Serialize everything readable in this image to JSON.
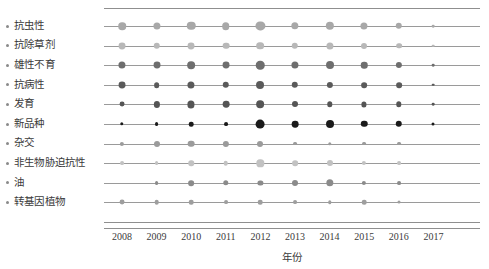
{
  "chart_data": {
    "type": "scatter",
    "title": "",
    "xlabel": "年份",
    "ylabel": "",
    "x": [
      2008,
      2009,
      2010,
      2011,
      2012,
      2013,
      2014,
      2015,
      2016,
      2017
    ],
    "xtick_labels": [
      "2008",
      "2009",
      "2010",
      "2011",
      "2012",
      "2013",
      "2014",
      "2015",
      "2016",
      "2017"
    ],
    "xlim": [
      2007.5,
      2017.5
    ],
    "grid": false,
    "legend": "none",
    "bubble_encoding": "marker area proportional to count; row color darkness distinguishes category",
    "categories": [
      "抗虫性",
      "抗除草剂",
      "雄性不育",
      "抗病性",
      "发育",
      "新品种",
      "杂交",
      "非生物胁迫抗性",
      "油",
      "转基因植物"
    ],
    "series": [
      {
        "name": "抗虫性",
        "color": "#a8a8a8",
        "values": [
          9.5,
          8.5,
          12.0,
          9.5,
          14.0,
          9.0,
          11.5,
          8.5,
          7.0,
          1.2
        ]
      },
      {
        "name": "抗除草剂",
        "color": "#b8b8b8",
        "values": [
          8.0,
          7.0,
          8.0,
          7.5,
          10.0,
          7.0,
          8.5,
          6.0,
          5.5,
          1.2
        ]
      },
      {
        "name": "雄性不育",
        "color": "#6e6e6e",
        "values": [
          8.5,
          8.0,
          10.0,
          8.0,
          12.0,
          8.5,
          10.5,
          7.0,
          6.5,
          1.2
        ]
      },
      {
        "name": "抗病性",
        "color": "#5a5a5a",
        "values": [
          8.0,
          5.5,
          8.5,
          7.0,
          10.5,
          7.0,
          6.5,
          5.5,
          5.5,
          1.2
        ]
      },
      {
        "name": "发育",
        "color": "#555555",
        "values": [
          4.0,
          6.5,
          8.5,
          7.5,
          10.0,
          6.0,
          5.0,
          4.5,
          5.0,
          1.2
        ]
      },
      {
        "name": "新品种",
        "color": "#1a1a1a",
        "values": [
          2.0,
          2.5,
          3.5,
          2.5,
          13.0,
          7.5,
          10.5,
          7.0,
          7.0,
          1.5
        ]
      },
      {
        "name": "杂交",
        "color": "#9b9b9b",
        "values": [
          3.0,
          6.0,
          7.5,
          6.5,
          6.0,
          2.5,
          2.0,
          2.5,
          2.5,
          0.0
        ]
      },
      {
        "name": "非生物胁迫抗性",
        "color": "#c2c2c2",
        "values": [
          2.5,
          2.5,
          5.0,
          3.5,
          9.0,
          5.5,
          6.0,
          3.0,
          2.5,
          0.0
        ]
      },
      {
        "name": "油",
        "color": "#8b8b8b",
        "values": [
          0.0,
          2.5,
          5.5,
          5.0,
          4.5,
          6.0,
          9.0,
          3.0,
          2.5,
          0.0
        ]
      },
      {
        "name": "转基因植物",
        "color": "#9e9e9e",
        "values": [
          4.0,
          3.5,
          3.5,
          2.5,
          3.5,
          2.5,
          2.0,
          3.5,
          1.5,
          0.0
        ]
      }
    ]
  }
}
